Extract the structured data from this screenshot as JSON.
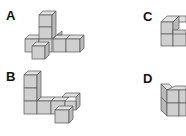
{
  "figure": {
    "options": [
      {
        "label": "A",
        "shape": "T-shaped cube arrangement with vertical tower of 3 cubes"
      },
      {
        "label": "B",
        "shape": "L-shaped cube arrangement with vertical column of 3 cubes"
      },
      {
        "label": "C",
        "shape": "Stepped cube arrangement, partially cropped"
      },
      {
        "label": "D",
        "shape": "2x2 block of cubes, partially cropped"
      }
    ]
  },
  "colors": {
    "cube_top": "#e0e0e0",
    "cube_front": "#cfcfcf",
    "cube_side": "#b9b9b9",
    "edge": "#555555",
    "label": "#111111"
  }
}
